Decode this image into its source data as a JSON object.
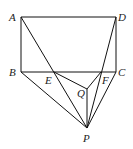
{
  "points": {
    "A": {
      "x": 21,
      "y": 17,
      "label": "A",
      "lx": 9,
      "ly": 21
    },
    "D": {
      "x": 116,
      "y": 17,
      "label": "D",
      "lx": 118,
      "ly": 21
    },
    "B": {
      "x": 21,
      "y": 72,
      "label": "B",
      "lx": 9,
      "ly": 76
    },
    "C": {
      "x": 116,
      "y": 72,
      "label": "C",
      "lx": 118,
      "ly": 76
    },
    "E": {
      "x": 54,
      "y": 72,
      "label": "E",
      "lx": 45,
      "ly": 84
    },
    "F": {
      "x": 101,
      "y": 72,
      "label": "F",
      "lx": 102,
      "ly": 84
    },
    "Q": {
      "x": 87,
      "y": 89,
      "label": "Q",
      "lx": 77,
      "ly": 97
    },
    "P": {
      "x": 87,
      "y": 128,
      "label": "P",
      "lx": 83,
      "ly": 142
    }
  },
  "segments": [
    [
      "A",
      "D"
    ],
    [
      "D",
      "C"
    ],
    [
      "C",
      "B"
    ],
    [
      "B",
      "A"
    ],
    [
      "A",
      "P"
    ],
    [
      "D",
      "P"
    ],
    [
      "B",
      "P"
    ],
    [
      "C",
      "P"
    ],
    [
      "E",
      "Q"
    ],
    [
      "Q",
      "F"
    ],
    [
      "Q",
      "P"
    ]
  ]
}
